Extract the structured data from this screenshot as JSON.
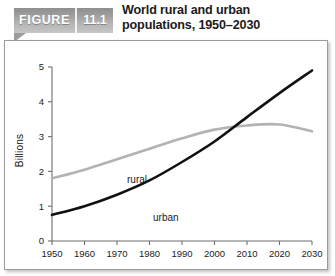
{
  "header": {
    "figure_word": "FIGURE",
    "figure_number": "11.1",
    "title_line1": "World rural and urban",
    "title_line2": "populations, 1950–2030"
  },
  "chart_data": {
    "type": "line",
    "title": "World rural and urban populations, 1950–2030",
    "xlabel": "",
    "ylabel": "Billions",
    "xlim": [
      1950,
      2030
    ],
    "ylim": [
      0,
      5
    ],
    "grid": false,
    "legend_position": "inline-labels",
    "xticks": [
      "1950",
      "1960",
      "1970",
      "1980",
      "1990",
      "2000",
      "2010",
      "2020",
      "2030"
    ],
    "yticks": [
      "0",
      "1",
      "2",
      "3",
      "4",
      "5"
    ],
    "x": [
      1950,
      1960,
      1970,
      1980,
      1990,
      2000,
      2010,
      2020,
      2030
    ],
    "series": [
      {
        "name": "rural",
        "color": "#b3b3b3",
        "label": "rural",
        "values": [
          1.8,
          2.05,
          2.35,
          2.65,
          2.95,
          3.2,
          3.32,
          3.35,
          3.15
        ]
      },
      {
        "name": "urban",
        "color": "#111111",
        "label": "urban",
        "values": [
          0.75,
          1.0,
          1.33,
          1.74,
          2.27,
          2.86,
          3.56,
          4.25,
          4.9
        ]
      }
    ]
  }
}
